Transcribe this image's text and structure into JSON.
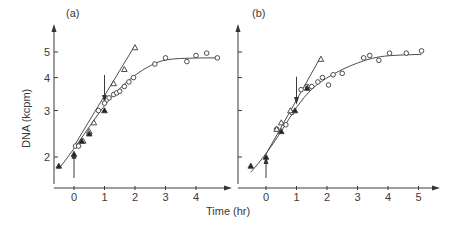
{
  "figure": {
    "xlabel": "Time (hr)",
    "ylabel": "DNA (kcpm)"
  },
  "chart_data": [
    {
      "panel": "(a)",
      "type": "scatter",
      "title": "(a)",
      "xlabel": "Time (hr)",
      "ylabel": "DNA (kcpm)",
      "yscale": "log",
      "xticks": [
        0,
        1,
        2,
        3,
        4
      ],
      "yticks": [
        2,
        3,
        4,
        5
      ],
      "xlim": [
        -0.7,
        5.0
      ],
      "ylim": [
        1.6,
        6.5
      ],
      "grid": false,
      "annotations": [
        {
          "type": "arrow-up",
          "x": 0,
          "label": "upward arrow at t=0"
        },
        {
          "type": "arrow-down",
          "x": 1,
          "label": "downward arrow at t=1"
        }
      ],
      "series": [
        {
          "name": "open circles",
          "marker": "circle-open",
          "x": [
            0.05,
            0.15,
            0.8,
            1.0,
            1.15,
            1.3,
            1.4,
            1.5,
            1.65,
            1.8,
            1.95,
            2.65,
            3.0,
            3.7,
            4.0,
            4.35,
            4.7
          ],
          "y": [
            2.2,
            2.2,
            3.0,
            3.2,
            3.35,
            3.45,
            3.5,
            3.55,
            3.7,
            3.85,
            4.0,
            4.5,
            4.75,
            4.6,
            4.85,
            4.95,
            4.75
          ]
        },
        {
          "name": "open triangles",
          "marker": "triangle-open",
          "x": [
            0.3,
            0.5,
            0.65,
            1.3,
            1.65,
            2.0
          ],
          "y": [
            2.3,
            2.5,
            2.7,
            3.8,
            4.3,
            5.2
          ]
        },
        {
          "name": "filled triangles",
          "marker": "triangle-filled",
          "x": [
            -0.5,
            0.0,
            0.25,
            0.5,
            1.0
          ],
          "y": [
            1.85,
            2.05,
            2.3,
            2.45,
            3.0
          ]
        }
      ],
      "curves": [
        {
          "name": "saturating fit",
          "x": [
            -0.5,
            0,
            0.5,
            1.0,
            1.5,
            2.0,
            2.5,
            3.0,
            4.0,
            4.7
          ],
          "y": [
            1.8,
            2.15,
            2.6,
            3.15,
            3.65,
            4.1,
            4.45,
            4.7,
            4.75,
            4.75
          ]
        },
        {
          "name": "exponential fit",
          "x": [
            0,
            2.0
          ],
          "y": [
            2.2,
            5.3
          ]
        }
      ]
    },
    {
      "panel": "(b)",
      "type": "scatter",
      "title": "(b)",
      "xlabel": "Time (hr)",
      "ylabel": "DNA (kcpm)",
      "yscale": "log",
      "xticks": [
        0,
        1,
        2,
        3,
        4,
        5
      ],
      "yticks": [
        2,
        3,
        4,
        5
      ],
      "xlim": [
        -0.9,
        5.4
      ],
      "ylim": [
        1.6,
        6.5
      ],
      "grid": false,
      "annotations": [
        {
          "type": "arrow-up",
          "x": 0,
          "label": "upward arrow at t=0"
        },
        {
          "type": "arrow-down",
          "x": 1,
          "label": "downward arrow at t=1"
        }
      ],
      "series": [
        {
          "name": "open circles",
          "marker": "circle-open",
          "x": [
            0.35,
            0.65,
            0.85,
            1.15,
            1.35,
            1.5,
            1.7,
            1.85,
            2.05,
            2.2,
            2.5,
            3.2,
            3.4,
            3.7,
            4.05,
            4.6,
            5.1
          ],
          "y": [
            2.55,
            2.65,
            2.95,
            3.6,
            3.7,
            3.7,
            3.85,
            4.0,
            3.75,
            4.1,
            4.15,
            4.75,
            4.85,
            4.65,
            4.95,
            4.95,
            5.05
          ]
        },
        {
          "name": "open triangles",
          "marker": "triangle-open",
          "x": [
            0.35,
            0.5,
            0.8,
            1.8
          ],
          "y": [
            2.55,
            2.7,
            3.0,
            4.7
          ]
        },
        {
          "name": "filled triangles",
          "marker": "triangle-filled",
          "x": [
            -0.5,
            0.0,
            0.5,
            0.95,
            1.35
          ],
          "y": [
            1.85,
            2.0,
            2.5,
            3.0,
            3.65
          ]
        }
      ],
      "curves": [
        {
          "name": "saturating fit",
          "x": [
            -0.5,
            0,
            0.5,
            1.0,
            1.5,
            2.0,
            2.5,
            3.0,
            3.5,
            4.0,
            5.1
          ],
          "y": [
            1.75,
            2.05,
            2.5,
            3.1,
            3.65,
            4.0,
            4.3,
            4.55,
            4.75,
            4.85,
            4.9
          ]
        },
        {
          "name": "exponential fit",
          "x": [
            0,
            1.8
          ],
          "y": [
            2.05,
            4.8
          ]
        }
      ]
    }
  ]
}
